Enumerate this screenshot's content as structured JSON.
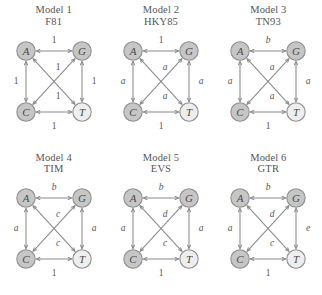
{
  "figure": {
    "layout": "2 rows x 3 columns of substitution-model graphs",
    "nodes": [
      "A",
      "G",
      "C",
      "T"
    ],
    "node_colors": {
      "dark": "#c6c6c6",
      "light": "#eeeeee",
      "border": "#8f8f8f"
    },
    "edge_color": "#8a8a8a"
  },
  "panels": [
    {
      "index_label": "Model 1",
      "model_name": "F81",
      "nodes": [
        {
          "id": "A",
          "label": "A",
          "shade": "dark"
        },
        {
          "id": "G",
          "label": "G",
          "shade": "dark"
        },
        {
          "id": "C",
          "label": "C",
          "shade": "dark"
        },
        {
          "id": "T",
          "label": "T",
          "shade": "light"
        }
      ],
      "edges": [
        {
          "from": "A",
          "to": "G",
          "position": "top",
          "label": "1",
          "italic": false
        },
        {
          "from": "C",
          "to": "T",
          "position": "bottom",
          "label": "1",
          "italic": false
        },
        {
          "from": "A",
          "to": "C",
          "position": "left",
          "label": "1",
          "italic": false
        },
        {
          "from": "G",
          "to": "T",
          "position": "right",
          "label": "1",
          "italic": false
        },
        {
          "from": "A",
          "to": "T",
          "position": "diagonal-upper",
          "label": "1",
          "italic": false
        },
        {
          "from": "C",
          "to": "G",
          "position": "diagonal-lower",
          "label": "1",
          "italic": false
        }
      ]
    },
    {
      "index_label": "Model 2",
      "model_name": "HKY85",
      "nodes": [
        {
          "id": "A",
          "label": "A",
          "shade": "dark"
        },
        {
          "id": "G",
          "label": "G",
          "shade": "dark"
        },
        {
          "id": "C",
          "label": "C",
          "shade": "dark"
        },
        {
          "id": "T",
          "label": "T",
          "shade": "light"
        }
      ],
      "edges": [
        {
          "from": "A",
          "to": "G",
          "position": "top",
          "label": "1",
          "italic": false
        },
        {
          "from": "C",
          "to": "T",
          "position": "bottom",
          "label": "1",
          "italic": false
        },
        {
          "from": "A",
          "to": "C",
          "position": "left",
          "label": "a",
          "italic": true
        },
        {
          "from": "G",
          "to": "T",
          "position": "right",
          "label": "a",
          "italic": true
        },
        {
          "from": "A",
          "to": "T",
          "position": "diagonal-upper",
          "label": "a",
          "italic": true
        },
        {
          "from": "C",
          "to": "G",
          "position": "diagonal-lower",
          "label": "a",
          "italic": true
        }
      ]
    },
    {
      "index_label": "Model 3",
      "model_name": "TN93",
      "nodes": [
        {
          "id": "A",
          "label": "A",
          "shade": "dark"
        },
        {
          "id": "G",
          "label": "G",
          "shade": "dark"
        },
        {
          "id": "C",
          "label": "C",
          "shade": "dark"
        },
        {
          "id": "T",
          "label": "T",
          "shade": "light"
        }
      ],
      "edges": [
        {
          "from": "A",
          "to": "G",
          "position": "top",
          "label": "b",
          "italic": true
        },
        {
          "from": "C",
          "to": "T",
          "position": "bottom",
          "label": "1",
          "italic": false
        },
        {
          "from": "A",
          "to": "C",
          "position": "left",
          "label": "a",
          "italic": true
        },
        {
          "from": "G",
          "to": "T",
          "position": "right",
          "label": "a",
          "italic": true
        },
        {
          "from": "A",
          "to": "T",
          "position": "diagonal-upper",
          "label": "a",
          "italic": true
        },
        {
          "from": "C",
          "to": "G",
          "position": "diagonal-lower",
          "label": "a",
          "italic": true
        }
      ]
    },
    {
      "index_label": "Model 4",
      "model_name": "TIM",
      "nodes": [
        {
          "id": "A",
          "label": "A",
          "shade": "dark"
        },
        {
          "id": "G",
          "label": "G",
          "shade": "dark"
        },
        {
          "id": "C",
          "label": "C",
          "shade": "dark"
        },
        {
          "id": "T",
          "label": "T",
          "shade": "light"
        }
      ],
      "edges": [
        {
          "from": "A",
          "to": "G",
          "position": "top",
          "label": "b",
          "italic": true
        },
        {
          "from": "C",
          "to": "T",
          "position": "bottom",
          "label": "1",
          "italic": false
        },
        {
          "from": "A",
          "to": "C",
          "position": "left",
          "label": "a",
          "italic": true
        },
        {
          "from": "G",
          "to": "T",
          "position": "right",
          "label": "a",
          "italic": true
        },
        {
          "from": "A",
          "to": "T",
          "position": "diagonal-upper",
          "label": "c",
          "italic": true
        },
        {
          "from": "C",
          "to": "G",
          "position": "diagonal-lower",
          "label": "c",
          "italic": true
        }
      ]
    },
    {
      "index_label": "Model 5",
      "model_name": "EVS",
      "nodes": [
        {
          "id": "A",
          "label": "A",
          "shade": "dark"
        },
        {
          "id": "G",
          "label": "G",
          "shade": "dark"
        },
        {
          "id": "C",
          "label": "C",
          "shade": "dark"
        },
        {
          "id": "T",
          "label": "T",
          "shade": "light"
        }
      ],
      "edges": [
        {
          "from": "A",
          "to": "G",
          "position": "top",
          "label": "b",
          "italic": true
        },
        {
          "from": "C",
          "to": "T",
          "position": "bottom",
          "label": "1",
          "italic": false
        },
        {
          "from": "A",
          "to": "C",
          "position": "left",
          "label": "a",
          "italic": true
        },
        {
          "from": "G",
          "to": "T",
          "position": "right",
          "label": "a",
          "italic": true
        },
        {
          "from": "A",
          "to": "T",
          "position": "diagonal-upper",
          "label": "d",
          "italic": true
        },
        {
          "from": "C",
          "to": "G",
          "position": "diagonal-lower",
          "label": "c",
          "italic": true
        }
      ]
    },
    {
      "index_label": "Model 6",
      "model_name": "GTR",
      "nodes": [
        {
          "id": "A",
          "label": "A",
          "shade": "dark"
        },
        {
          "id": "G",
          "label": "G",
          "shade": "dark"
        },
        {
          "id": "C",
          "label": "C",
          "shade": "dark"
        },
        {
          "id": "T",
          "label": "T",
          "shade": "light"
        }
      ],
      "edges": [
        {
          "from": "A",
          "to": "G",
          "position": "top",
          "label": "b",
          "italic": true
        },
        {
          "from": "C",
          "to": "T",
          "position": "bottom",
          "label": "1",
          "italic": false
        },
        {
          "from": "A",
          "to": "C",
          "position": "left",
          "label": "a",
          "italic": true
        },
        {
          "from": "G",
          "to": "T",
          "position": "right",
          "label": "e",
          "italic": true
        },
        {
          "from": "A",
          "to": "T",
          "position": "diagonal-upper",
          "label": "d",
          "italic": true
        },
        {
          "from": "C",
          "to": "G",
          "position": "diagonal-lower",
          "label": "c",
          "italic": true
        }
      ]
    }
  ]
}
